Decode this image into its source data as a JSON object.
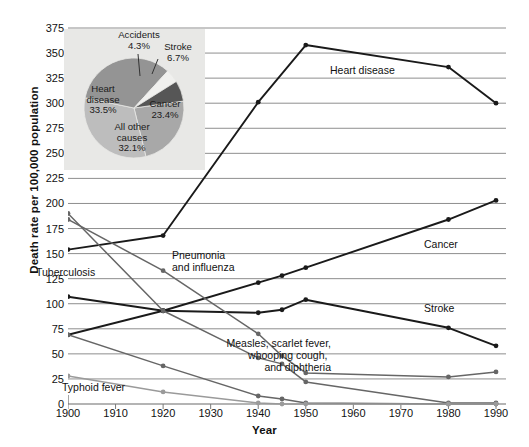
{
  "chart_data": {
    "type": "line",
    "title": "",
    "xlabel": "Year",
    "ylabel": "Death rate per 100,000 population",
    "xlim": [
      1900,
      1990
    ],
    "ylim": [
      0,
      375
    ],
    "ytick_step": 25,
    "xtick_step": 10,
    "grid": true,
    "legend": "inline-labels",
    "xticks": [
      "1900",
      "1910",
      "1920",
      "1930",
      "1940",
      "1950",
      "1960",
      "1970",
      "1980",
      "1990"
    ],
    "yticks": [
      "0",
      "25",
      "50",
      "75",
      "100",
      "125",
      "150",
      "175",
      "200",
      "225",
      "250",
      "275",
      "300",
      "325",
      "350",
      "375"
    ],
    "series": [
      {
        "name": "Heart disease",
        "label": "Heart disease",
        "color": "#1a1a1a",
        "x": [
          1900,
          1920,
          1940,
          1950,
          1980,
          1990
        ],
        "values": [
          154,
          168,
          301,
          358,
          336,
          300
        ]
      },
      {
        "name": "Cancer",
        "label": "Cancer",
        "color": "#1a1a1a",
        "x": [
          1900,
          1920,
          1940,
          1945,
          1950,
          1980,
          1990
        ],
        "values": [
          69,
          93,
          121,
          128,
          136,
          184,
          203
        ]
      },
      {
        "name": "Stroke",
        "label": "Stroke",
        "color": "#1a1a1a",
        "x": [
          1900,
          1920,
          1940,
          1945,
          1950,
          1980,
          1990
        ],
        "values": [
          107,
          93,
          91,
          94,
          104,
          76,
          58
        ]
      },
      {
        "name": "Pneumonia and influenza",
        "label": "Pneumonia\nand influenza",
        "color": "#666666",
        "x": [
          1900,
          1920,
          1940,
          1945,
          1950,
          1980,
          1990
        ],
        "values": [
          184,
          133,
          70,
          48,
          31,
          27,
          32
        ]
      },
      {
        "name": "Tuberculosis",
        "label": "Tuberculosis",
        "color": "#666666",
        "x": [
          1900,
          1920,
          1940,
          1945,
          1950,
          1980,
          1990
        ],
        "values": [
          190,
          93,
          46,
          40,
          22,
          1,
          1
        ]
      },
      {
        "name": "Measles, scarlet fever, whooping cough, and diphtheria",
        "label": "Measles, scarlet fever,\nwhooping cough,\nand diphtheria",
        "color": "#666666",
        "x": [
          1900,
          1920,
          1940,
          1945,
          1950,
          1980,
          1990
        ],
        "values": [
          69,
          38,
          8,
          5,
          1,
          0,
          0
        ]
      },
      {
        "name": "Typhoid fever",
        "label": "Typhoid fever",
        "color": "#9a9a9a",
        "x": [
          1900,
          1920,
          1940,
          1945,
          1950,
          1980,
          1990
        ],
        "values": [
          28,
          12,
          1,
          0,
          0,
          0,
          0
        ]
      }
    ],
    "annotations": [
      {
        "name": "heart-disease-label",
        "text": "Heart disease"
      },
      {
        "name": "cancer-label",
        "text": "Cancer"
      },
      {
        "name": "stroke-label",
        "text": "Stroke"
      },
      {
        "name": "pneumonia-label-line1",
        "text": "Pneumonia"
      },
      {
        "name": "pneumonia-label-line2",
        "text": "and influenza"
      },
      {
        "name": "tuberculosis-label",
        "text": "Tuberculosis"
      },
      {
        "name": "measles-label-line1",
        "text": "Measles, scarlet fever,"
      },
      {
        "name": "measles-label-line2",
        "text": "whooping cough,"
      },
      {
        "name": "measles-label-line3",
        "text": "and diphtheria"
      },
      {
        "name": "typhoid-label",
        "text": "Typhoid fever"
      }
    ],
    "inset": {
      "type": "pie",
      "background": "#e8e8e6",
      "categories": [
        "Heart disease",
        "Cancer",
        "All other causes",
        "Stroke",
        "Accidents"
      ],
      "values": [
        33.5,
        23.4,
        32.1,
        6.7,
        4.3
      ],
      "value_labels": [
        "33.5%",
        "23.4%",
        "32.1%",
        "6.7%",
        "4.3%"
      ],
      "colors": [
        "#949494",
        "#a8a8a8",
        "#bdbdbd",
        "#8a8a8a",
        "#565656"
      ],
      "slices": [
        {
          "name": "Cancer",
          "label": "Cancer",
          "value_label": "23.4%",
          "color": "#a8a8a8"
        },
        {
          "name": "All other causes",
          "label": "All other\ncauses",
          "value_label": "32.1%",
          "color": "#bdbdbd"
        },
        {
          "name": "Heart disease",
          "label": "Heart\ndisease",
          "value_label": "33.5%",
          "color": "#949494"
        },
        {
          "name": "Accidents",
          "label": "Accidents",
          "value_label": "4.3%",
          "color": "#e8e8e6"
        },
        {
          "name": "Stroke",
          "label": "Stroke",
          "value_label": "6.7%",
          "color": "#565656"
        }
      ],
      "labels": {
        "accidents": "Accidents",
        "accidents_pct": "4.3%",
        "stroke": "Stroke",
        "stroke_pct": "6.7%",
        "heart_l1": "Heart",
        "heart_l2": "disease",
        "heart_pct": "33.5%",
        "cancer": "Cancer",
        "cancer_pct": "23.4%",
        "other_l1": "All other",
        "other_l2": "causes",
        "other_pct": "32.1%"
      }
    }
  },
  "axes": {
    "ylabel": "Death rate per 100,000 population",
    "xlabel": "Year"
  }
}
